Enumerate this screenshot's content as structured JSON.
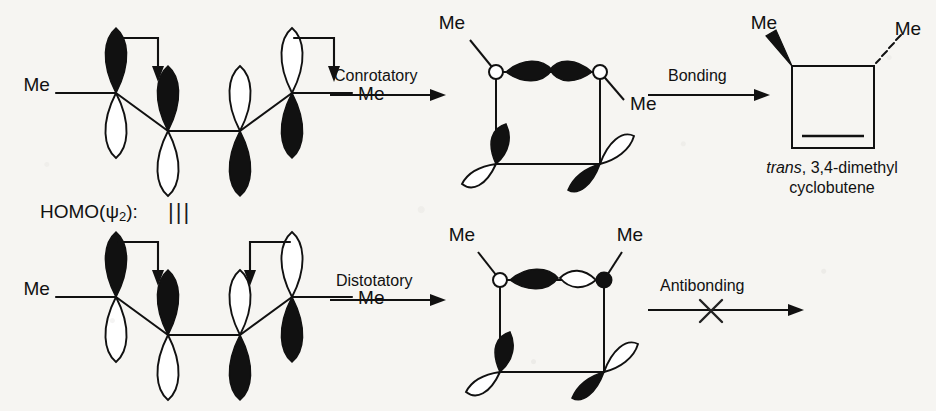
{
  "diagram": {
    "homo_label": "HOMO(",
    "homo_symbol": "ψ",
    "homo_subscript": "2",
    "homo_label_end": "):",
    "brace_marker": "|||",
    "ink_color": "#111111",
    "paper_color": "#f6f5f2"
  },
  "reactant_top": {
    "name": "butadiene-homo-conrotatory",
    "me_left": "Me",
    "me_right": "Me",
    "rotation_left": "clockwise",
    "rotation_right": "clockwise"
  },
  "reactant_bottom": {
    "name": "butadiene-homo-disrotatory",
    "me_left": "Me",
    "me_right": "Me",
    "rotation_left": "clockwise",
    "rotation_right": "counter-clockwise"
  },
  "arrows": {
    "conrotatory": "Conrotatory",
    "distotatory": "Distotatory",
    "bonding": "Bonding",
    "antibonding": "Antibonding",
    "blocked_marker": "X"
  },
  "ts_top": {
    "name": "conrotatory-transition-state",
    "me_left": "Me",
    "me_right": "Me",
    "overlap": "bonding"
  },
  "ts_bottom": {
    "name": "disrotatory-transition-state",
    "me_left": "Me",
    "me_right": "Me",
    "overlap": "antibonding"
  },
  "product": {
    "name": "trans-3,4-dimethylcyclobutene",
    "me_wedge": "Me",
    "me_dash": "Me",
    "caption_italic": "trans",
    "caption_rest": ", 3,4-dimethyl",
    "caption_line2": "cyclobutene"
  }
}
